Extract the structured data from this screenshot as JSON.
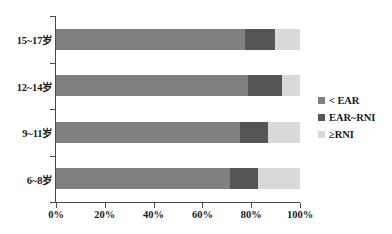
{
  "chart_data": {
    "type": "bar",
    "orientation": "horizontal",
    "stacked": true,
    "normalized_percent": true,
    "title": "",
    "subtitle": "",
    "xlabel": "",
    "ylabel": "",
    "categories": [
      "15~17岁",
      "12~14岁",
      "9~11岁",
      "6~8岁"
    ],
    "series": [
      {
        "name": "< EAR",
        "color": "#808080",
        "values": [
          77.5,
          78.7,
          75.4,
          71.3
        ]
      },
      {
        "name": "EAR~RNI",
        "color": "#555555",
        "values": [
          12.3,
          13.9,
          11.5,
          11.5
        ]
      },
      {
        "name": "≥RNI",
        "color": "#d9d9d9",
        "values": [
          10.2,
          7.4,
          13.1,
          17.2
        ]
      }
    ],
    "xlim": [
      0,
      100
    ],
    "xticks": [
      0,
      20,
      40,
      60,
      80,
      100
    ],
    "xticklabels": [
      "0%",
      "20%",
      "40%",
      "60%",
      "80%",
      "100%"
    ],
    "grid": false,
    "legend_position": "right"
  },
  "legend": {
    "items": [
      {
        "label": "< EAR",
        "color": "#808080"
      },
      {
        "label": "EAR~RNI",
        "color": "#555555"
      },
      {
        "label": "≥RNI",
        "color": "#d9d9d9"
      }
    ]
  },
  "axes": {
    "x_labels": [
      "0%",
      "20%",
      "40%",
      "60%",
      "80%",
      "100%"
    ],
    "y_labels": [
      "15~17岁",
      "12~14岁",
      "9~11岁",
      "6~8岁"
    ]
  },
  "colors": {
    "axis": "#4a4a4a",
    "background": "#ffffff",
    "text": "#1a1a1a"
  }
}
